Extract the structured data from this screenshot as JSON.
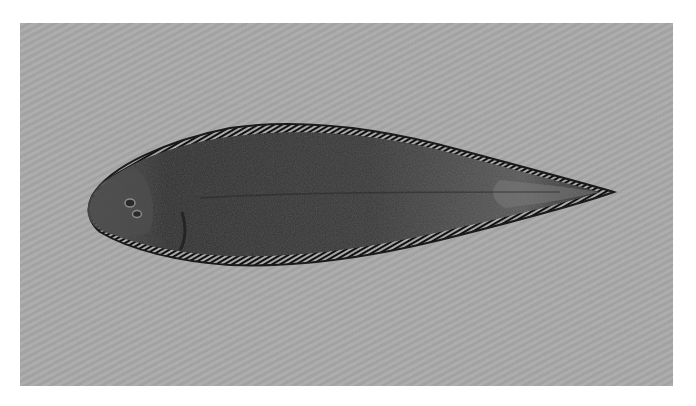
{
  "image": {
    "subject": "Flatfish (tonguefish/sole) specimen, dorsal (eyed) side view",
    "orientation": "head facing left, tapered pointed tail to the right",
    "background": "uniform gray studio backdrop",
    "colors": {
      "page_background": "#ffffff",
      "panel_background": "#a9a9a9",
      "fish_body": "#3a3a3a",
      "fish_dark": "#1e1e1e",
      "fin_fringe": "#141414",
      "tail_highlight": "#6a6a6a"
    }
  },
  "caption": {
    "text": ""
  }
}
